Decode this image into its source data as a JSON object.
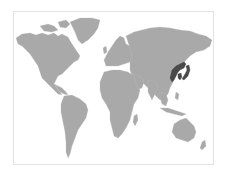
{
  "map": {
    "type": "world-locator-map",
    "colors": {
      "background": "#ffffff",
      "land": "#a9a9a9",
      "highlight": "#4a4a4a",
      "frame": "#e3e3e3"
    },
    "highlighted_region": "Northeast Asia (Manchuria, Korea, Japan)",
    "regions": [
      {
        "name": "north-america",
        "highlighted": false
      },
      {
        "name": "greenland",
        "highlighted": false
      },
      {
        "name": "south-america",
        "highlighted": false
      },
      {
        "name": "europe",
        "highlighted": false
      },
      {
        "name": "africa",
        "highlighted": false
      },
      {
        "name": "asia",
        "highlighted": false
      },
      {
        "name": "northeast-asia",
        "highlighted": true
      },
      {
        "name": "australia",
        "highlighted": false
      }
    ]
  }
}
